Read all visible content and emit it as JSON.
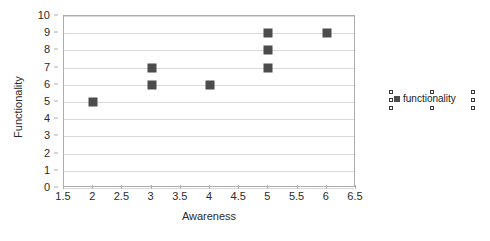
{
  "chart_data": {
    "type": "scatter",
    "title": "",
    "xlabel": "Awareness",
    "ylabel": "Functionality",
    "xlim": [
      1.5,
      6.5
    ],
    "ylim": [
      0,
      10
    ],
    "xticks": [
      "1.5",
      "2",
      "2.5",
      "3",
      "3.5",
      "4",
      "4.5",
      "5",
      "5.5",
      "6",
      "6.5"
    ],
    "xtick_values": [
      1.5,
      2,
      2.5,
      3,
      3.5,
      4,
      4.5,
      5,
      5.5,
      6,
      6.5
    ],
    "yticks": [
      "0",
      "1",
      "2",
      "3",
      "4",
      "5",
      "6",
      "7",
      "8",
      "9",
      "10"
    ],
    "ytick_values": [
      0,
      1,
      2,
      3,
      4,
      5,
      6,
      7,
      8,
      9,
      10
    ],
    "grid": "horizontal",
    "legend_position": "right",
    "marker_color": "#4c4c4c",
    "marker_shape": "square",
    "series": [
      {
        "name": "functionality",
        "x": [
          2,
          3,
          3,
          4,
          5,
          5,
          5,
          6
        ],
        "y": [
          5,
          6,
          7,
          6,
          7,
          8,
          9,
          9
        ]
      }
    ]
  },
  "legend": {
    "label": "functionality",
    "selected": true
  },
  "axes": {
    "x_title": "Awareness",
    "y_title": "Functionality"
  }
}
